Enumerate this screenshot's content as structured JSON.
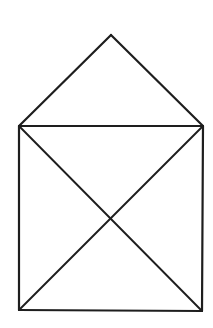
{
  "figure": {
    "type": "geometric-line-drawing",
    "stroke_color": "#1e1e1e",
    "background_color": "#ffffff",
    "vertices": {
      "apex": [
        111,
        35
      ],
      "top_left": [
        19,
        126
      ],
      "top_right": [
        203,
        126
      ],
      "bottom_left": [
        19,
        310
      ],
      "bottom_right": [
        202,
        311
      ],
      "center": [
        110,
        218
      ]
    },
    "edges": [
      {
        "name": "roof-left",
        "from": "apex",
        "to": "top_left"
      },
      {
        "name": "roof-right",
        "from": "apex",
        "to": "top_right"
      },
      {
        "name": "square-top",
        "from": "top_left",
        "to": "top_right"
      },
      {
        "name": "square-left",
        "from": "top_left",
        "to": "bottom_left"
      },
      {
        "name": "square-right",
        "from": "top_right",
        "to": "bottom_right"
      },
      {
        "name": "square-bottom",
        "from": "bottom_left",
        "to": "bottom_right"
      },
      {
        "name": "diagonal-tl-br",
        "from": "top_left",
        "to": "bottom_right"
      },
      {
        "name": "diagonal-tr-bl",
        "from": "top_right",
        "to": "bottom_left"
      }
    ]
  }
}
